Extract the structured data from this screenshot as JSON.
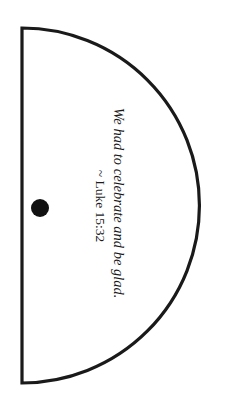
{
  "shape": {
    "type": "semicircle-template",
    "stroke_color": "#1a1a1a",
    "fill_color": "#ffffff",
    "hole": {
      "icon": "punch-hole",
      "color": "#111111"
    }
  },
  "verse": {
    "quote": "We had to celebrate and be glad.",
    "reference": "~ Luke 15:32"
  }
}
